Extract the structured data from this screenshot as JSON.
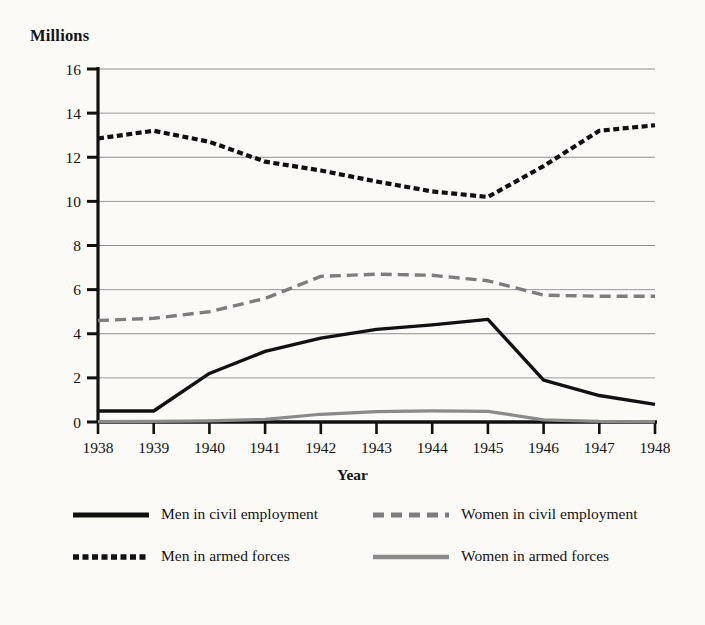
{
  "chart_data": {
    "type": "line",
    "title": "",
    "subtitle": "",
    "unit_label": "Millions",
    "xlabel": "Year",
    "ylabel": "Millions",
    "grid": true,
    "legend_position": "bottom",
    "categories": [
      "1938",
      "1939",
      "1940",
      "1941",
      "1942",
      "1943",
      "1944",
      "1945",
      "1946",
      "1947",
      "1948"
    ],
    "x": [
      1938,
      1939,
      1940,
      1941,
      1942,
      1943,
      1944,
      1945,
      1946,
      1947,
      1948
    ],
    "xlim": [
      1938,
      1948
    ],
    "ylim": [
      0,
      16
    ],
    "yticks": [
      0,
      2,
      4,
      6,
      8,
      10,
      12,
      14,
      16
    ],
    "series": [
      {
        "name": "Men in civil employment",
        "style": "solid",
        "color": "#111111",
        "width": 3.4,
        "values": [
          0.5,
          0.5,
          2.2,
          3.2,
          3.8,
          4.2,
          4.4,
          4.65,
          1.9,
          1.2,
          0.8
        ]
      },
      {
        "name": "Women in civil employment",
        "style": "dashed",
        "color": "#7d7d7d",
        "width": 3.4,
        "dash": "11,6",
        "values": [
          4.6,
          4.7,
          5.0,
          5.6,
          6.6,
          6.7,
          6.65,
          6.4,
          5.75,
          5.7,
          5.7
        ]
      },
      {
        "name": "Men in armed forces",
        "style": "dotted-dash",
        "color": "#111111",
        "width": 4.2,
        "dash": "6,3.5",
        "values": [
          12.85,
          13.2,
          12.7,
          11.8,
          11.4,
          10.9,
          10.45,
          10.2,
          11.6,
          13.2,
          13.45
        ]
      },
      {
        "name": "Women in armed forces",
        "style": "solid",
        "color": "#8a8a8a",
        "width": 3.2,
        "values": [
          0.02,
          0.03,
          0.05,
          0.12,
          0.35,
          0.47,
          0.5,
          0.48,
          0.1,
          0.03,
          0.02
        ]
      }
    ]
  },
  "legend": {
    "items": [
      {
        "label": "Men in civil employment",
        "swatch": "solid-black-line-icon"
      },
      {
        "label": "Women in civil employment",
        "swatch": "dashed-gray-line-icon"
      },
      {
        "label": "Men in armed forces",
        "swatch": "dotted-black-line-icon"
      },
      {
        "label": "Women in armed forces",
        "swatch": "solid-gray-line-icon"
      }
    ]
  },
  "colors": {
    "background": "#fbfaf7",
    "axis": "#111111",
    "grid": "#8e8e8e",
    "text": "#141414"
  }
}
